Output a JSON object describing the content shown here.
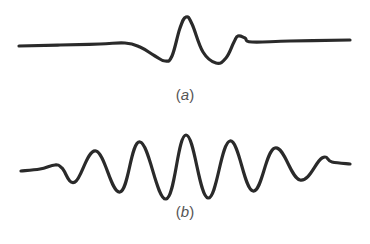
{
  "figure": {
    "panels": [
      {
        "id": "a",
        "label_open": "(",
        "label_var": "a",
        "label_close": ")",
        "description": "single localized pulse / wave packet with one main crest",
        "stroke_color": "#2a2a2a",
        "points": [
          [
            19,
            46
          ],
          [
            60,
            45
          ],
          [
            100,
            44
          ],
          [
            125,
            43
          ],
          [
            140,
            47
          ],
          [
            155,
            56
          ],
          [
            165,
            61
          ],
          [
            172,
            56
          ],
          [
            180,
            28
          ],
          [
            186,
            17
          ],
          [
            192,
            24
          ],
          [
            203,
            52
          ],
          [
            216,
            63
          ],
          [
            226,
            58
          ],
          [
            234,
            42
          ],
          [
            238,
            36
          ],
          [
            245,
            38
          ],
          [
            252,
            42
          ],
          [
            290,
            41
          ],
          [
            350,
            40
          ]
        ]
      },
      {
        "id": "b",
        "label_open": "(",
        "label_var": "b",
        "label_close": ")",
        "description": "extended wave train with many oscillations under a broad envelope",
        "stroke_color": "#2a2a2a",
        "points": [
          [
            21,
            171
          ],
          [
            40,
            169
          ],
          [
            55,
            165
          ],
          [
            62,
            168
          ],
          [
            75,
            182
          ],
          [
            96,
            151
          ],
          [
            120,
            192
          ],
          [
            140,
            142
          ],
          [
            166,
            199
          ],
          [
            186,
            135
          ],
          [
            208,
            198
          ],
          [
            230,
            141
          ],
          [
            253,
            191
          ],
          [
            275,
            148
          ],
          [
            300,
            180
          ],
          [
            322,
            158
          ],
          [
            332,
            162
          ],
          [
            350,
            164
          ]
        ]
      }
    ]
  }
}
